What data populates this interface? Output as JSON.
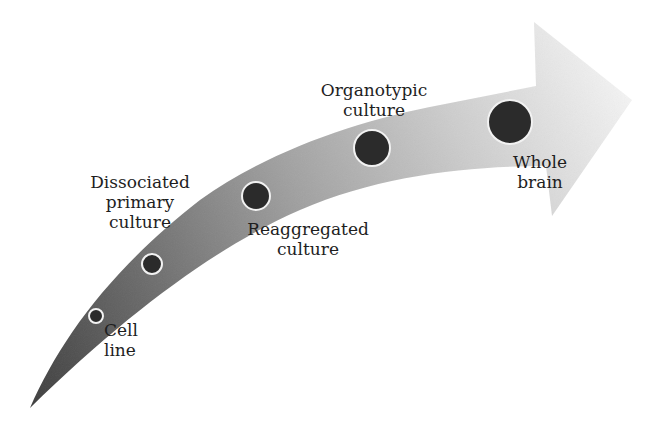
{
  "diagram": {
    "type": "progression-arrow",
    "direction": "left-to-right, increasing complexity",
    "colors": {
      "arrow_tail": "#464646",
      "arrow_mid": "#9a9a9a",
      "arrow_head": "#ececec",
      "node_fill": "#2b2b2b",
      "node_stroke": "#f2f2f2",
      "label_text": "#1e1e1e"
    },
    "stages": [
      {
        "id": "cell-line",
        "lines": [
          "Cell",
          "line"
        ],
        "node": {
          "cx": 96,
          "cy": 316,
          "r": 7
        }
      },
      {
        "id": "dissociated-primary-culture",
        "lines": [
          "Dissociated",
          "primary",
          "culture"
        ],
        "node": {
          "cx": 152,
          "cy": 264,
          "r": 10
        }
      },
      {
        "id": "reaggregated-culture",
        "lines": [
          "Reaggregated",
          "culture"
        ],
        "node": {
          "cx": 256,
          "cy": 196,
          "r": 14
        }
      },
      {
        "id": "organotypic-culture",
        "lines": [
          "Organotypic",
          "culture"
        ],
        "node": {
          "cx": 372,
          "cy": 148,
          "r": 18
        }
      },
      {
        "id": "whole-brain",
        "lines": [
          "Whole",
          "brain"
        ],
        "node": {
          "cx": 510,
          "cy": 122,
          "r": 22
        }
      }
    ]
  }
}
